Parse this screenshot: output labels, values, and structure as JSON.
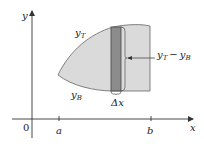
{
  "figure": {
    "type": "area-between-curves-diagram",
    "axes": {
      "x_label": "x",
      "y_label": "y",
      "origin_label": "0",
      "x_ticks": [
        "a",
        "b"
      ]
    },
    "curves": {
      "top_label_main": "y",
      "top_label_sub": "T",
      "bottom_label_main": "y",
      "bottom_label_sub": "B"
    },
    "strip": {
      "width_label": "Δx",
      "height_label_parts": {
        "a_main": "y",
        "a_sub": "T",
        "op": "−",
        "b_main": "y",
        "b_sub": "B"
      }
    },
    "colors": {
      "region_fill": "#d9d9d9",
      "strip_fill": "#8a8a8a",
      "outline": "#555555",
      "axis": "#333333"
    }
  }
}
